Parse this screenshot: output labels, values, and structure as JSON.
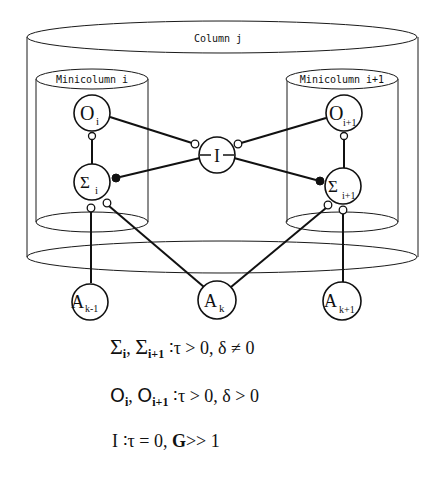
{
  "diagram": {
    "column_label": "Column j",
    "minicolumn_left_label": "Minicolumn  i",
    "minicolumn_right_label": "Minicolumn  i+1",
    "nodes": {
      "O_i": {
        "main": "O",
        "sub": "i"
      },
      "O_i1": {
        "main": "O",
        "sub": "i+1"
      },
      "Sigma_i": {
        "main": "Σ",
        "sub": "i"
      },
      "Sigma_i1": {
        "main": "Σ",
        "sub": "i+1"
      },
      "I": {
        "main": "I"
      },
      "A_km1": {
        "main": "A",
        "sub": "k-1"
      },
      "A_k": {
        "main": "A",
        "sub": "k"
      },
      "A_kp1": {
        "main": "A",
        "sub": "k+1"
      }
    },
    "edges": [
      {
        "from": "O_i",
        "to": "I",
        "synapse": "open"
      },
      {
        "from": "O_i1",
        "to": "I",
        "synapse": "open"
      },
      {
        "from": "I",
        "to": "Sigma_i",
        "synapse": "filled"
      },
      {
        "from": "I",
        "to": "Sigma_i1",
        "synapse": "filled"
      },
      {
        "from": "Sigma_i",
        "to": "O_i",
        "synapse": "open"
      },
      {
        "from": "Sigma_i1",
        "to": "O_i1",
        "synapse": "open"
      },
      {
        "from": "A_km1",
        "to": "Sigma_i",
        "synapse": "open"
      },
      {
        "from": "A_k",
        "to": "Sigma_i",
        "synapse": "open"
      },
      {
        "from": "A_k",
        "to": "Sigma_i1",
        "synapse": "open"
      },
      {
        "from": "A_kp1",
        "to": "Sigma_i1",
        "synapse": "open"
      }
    ]
  },
  "formulas": {
    "line1": {
      "sym1": "Σ",
      "sub1": "i",
      "sep": ", ",
      "sym2": "Σ",
      "sub2": "i+1",
      "rest": " ∶τ > 0,  δ ≠ 0"
    },
    "line2": {
      "sym1": "O",
      "sub1": "i",
      "sep": ", ",
      "sym2": "O",
      "sub2": "i+1",
      "rest": " ∶τ > 0,  δ > 0"
    },
    "line3": {
      "sym1": "I",
      "rest1": " ∶τ = 0, ",
      "bold": "G",
      "rest2": ">> 1"
    }
  }
}
